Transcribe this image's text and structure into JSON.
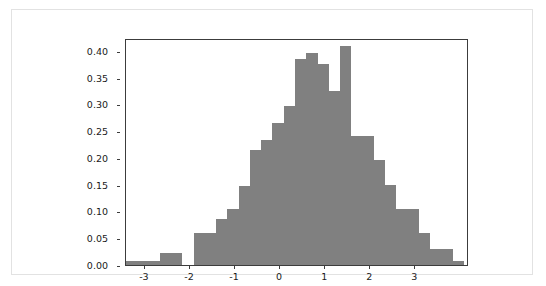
{
  "chart_data": {
    "type": "bar",
    "title": "",
    "subtitle": "",
    "xlabel": "",
    "ylabel": "",
    "grid": false,
    "legend": false,
    "xlim": [
      -3.42,
      4.19
    ],
    "ylim": [
      0.0,
      0.424
    ],
    "bin_width": 0.25,
    "y_ticks": [
      "0.00",
      "0.05",
      "0.10",
      "0.15",
      "0.20",
      "0.25",
      "0.30",
      "0.35",
      "0.40"
    ],
    "y_tick_values": [
      0.0,
      0.05,
      0.1,
      0.15,
      0.2,
      0.25,
      0.3,
      0.35,
      0.4
    ],
    "x_ticks": [
      "-3",
      "-2",
      "-1",
      "0",
      "1",
      "2",
      "3"
    ],
    "x_tick_values": [
      -3,
      -2,
      -1,
      0,
      1,
      2,
      3
    ],
    "bar_color": "#808080",
    "axis_color": "#3c3c3c",
    "bin_edges": [
      -3.42,
      -3.17,
      -2.92,
      -2.67,
      -2.42,
      -2.17,
      -1.92,
      -1.67,
      -1.42,
      -1.17,
      -0.92,
      -0.67,
      -0.42,
      -0.17,
      0.08,
      0.33,
      0.58,
      0.83,
      1.08,
      1.33,
      1.58,
      1.83,
      2.08,
      2.33,
      2.58,
      2.83,
      3.08,
      3.33,
      3.58,
      3.83
    ],
    "bars": [
      {
        "x0": -3.42,
        "x1": -3.17,
        "value": 0.008
      },
      {
        "x0": -3.17,
        "x1": -2.92,
        "value": 0.008
      },
      {
        "x0": -2.92,
        "x1": -2.67,
        "value": 0.008
      },
      {
        "x0": -2.67,
        "x1": -2.42,
        "value": 0.022
      },
      {
        "x0": -2.42,
        "x1": -2.17,
        "value": 0.022
      },
      {
        "x0": -2.17,
        "x1": -1.92,
        "value": 0.0
      },
      {
        "x0": -1.92,
        "x1": -1.67,
        "value": 0.06
      },
      {
        "x0": -1.67,
        "x1": -1.42,
        "value": 0.06
      },
      {
        "x0": -1.42,
        "x1": -1.17,
        "value": 0.086
      },
      {
        "x0": -1.17,
        "x1": -0.92,
        "value": 0.105
      },
      {
        "x0": -0.92,
        "x1": -0.67,
        "value": 0.148
      },
      {
        "x0": -0.67,
        "x1": -0.42,
        "value": 0.215
      },
      {
        "x0": -0.42,
        "x1": -0.17,
        "value": 0.233
      },
      {
        "x0": -0.17,
        "x1": 0.08,
        "value": 0.266
      },
      {
        "x0": 0.08,
        "x1": 0.33,
        "value": 0.297
      },
      {
        "x0": 0.33,
        "x1": 0.58,
        "value": 0.385
      },
      {
        "x0": 0.58,
        "x1": 0.83,
        "value": 0.396
      },
      {
        "x0": 0.83,
        "x1": 1.08,
        "value": 0.376
      },
      {
        "x0": 1.08,
        "x1": 1.33,
        "value": 0.325
      },
      {
        "x0": 1.33,
        "x1": 1.58,
        "value": 0.41
      },
      {
        "x0": 1.58,
        "x1": 1.83,
        "value": 0.241
      },
      {
        "x0": 1.83,
        "x1": 2.08,
        "value": 0.241
      },
      {
        "x0": 2.08,
        "x1": 2.33,
        "value": 0.196
      },
      {
        "x0": 2.33,
        "x1": 2.58,
        "value": 0.15
      },
      {
        "x0": 2.58,
        "x1": 2.83,
        "value": 0.105
      },
      {
        "x0": 2.83,
        "x1": 3.08,
        "value": 0.105
      },
      {
        "x0": 3.08,
        "x1": 3.33,
        "value": 0.06
      },
      {
        "x0": 3.33,
        "x1": 3.58,
        "value": 0.03
      },
      {
        "x0": 3.58,
        "x1": 3.83,
        "value": 0.03
      },
      {
        "x0": 3.83,
        "x1": 4.08,
        "value": 0.008
      }
    ]
  }
}
